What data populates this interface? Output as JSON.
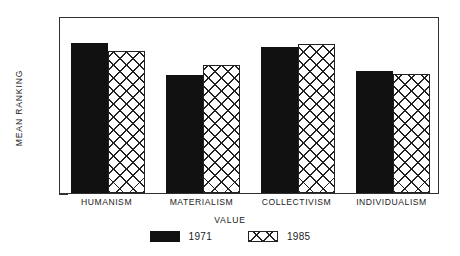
{
  "chart_data": {
    "type": "bar",
    "title": "",
    "subtitle": "",
    "xlabel": "VALUE",
    "ylabel": "MEAN RANKING",
    "categories": [
      "HUMANISM",
      "MATERIALISM",
      "COLLECTIVISM",
      "INDIVIDUALISM"
    ],
    "series": [
      {
        "name": "1971",
        "values": [
          5.1,
          4.0,
          4.95,
          4.15
        ],
        "fill": "solid-black",
        "color": "#111111"
      },
      {
        "name": "1985",
        "values": [
          4.8,
          4.35,
          5.05,
          4.05
        ],
        "fill": "crosshatch",
        "color": "#222222"
      }
    ],
    "ylim": [
      0,
      6
    ],
    "yticks": [
      0,
      1,
      2,
      3,
      4,
      5,
      6
    ],
    "ytick_labels": [
      "0",
      "1",
      "2",
      "3",
      "4",
      "5",
      "6"
    ],
    "grid": false,
    "legend_position": "bottom-center",
    "frame": "box"
  },
  "legend": {
    "entries": [
      {
        "label": "1971",
        "swatch": "solid-black-swatch"
      },
      {
        "label": "1985",
        "swatch": "crosshatch-swatch"
      }
    ]
  }
}
